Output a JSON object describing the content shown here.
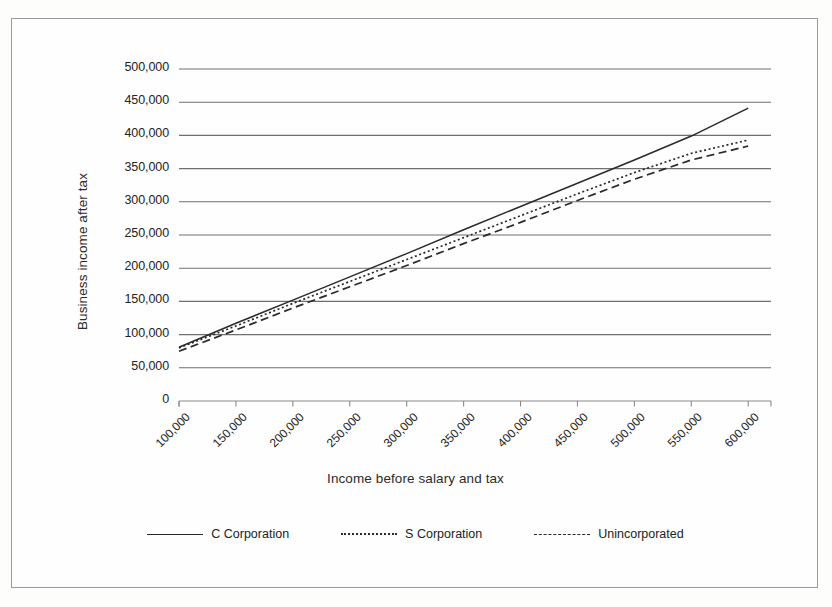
{
  "figure": {
    "background_color": "#fefefe",
    "border_color": "#9a9a9a"
  },
  "chart_data": {
    "type": "line",
    "title": "",
    "xlabel": "Income before salary and tax",
    "ylabel": "Business income after tax",
    "x": [
      100000,
      150000,
      200000,
      250000,
      300000,
      350000,
      400000,
      450000,
      500000,
      550000,
      600000
    ],
    "xlim": [
      100000,
      620000
    ],
    "ylim": [
      0,
      500000
    ],
    "ytick_labels": [
      "500,000",
      "450,000",
      "400,000",
      "350,000",
      "300,000",
      "250,000",
      "200,000",
      "150,000",
      "100,000",
      "50,000",
      "0"
    ],
    "ytick_values": [
      500000,
      450000,
      400000,
      350000,
      300000,
      250000,
      200000,
      150000,
      100000,
      50000,
      0
    ],
    "xtick_labels": [
      "100,000",
      "150,000",
      "200,000",
      "250,000",
      "300,000",
      "350,000",
      "400,000",
      "450,000",
      "500,000",
      "550,000",
      "600,000"
    ],
    "grid": "horizontal",
    "legend_position": "bottom",
    "series": [
      {
        "name": "C Corporation",
        "style": "solid",
        "color": "#2a2a2a",
        "values": [
          81000,
          117000,
          152000,
          187000,
          222000,
          258000,
          293000,
          328000,
          363000,
          399000,
          441000
        ]
      },
      {
        "name": "S Corporation",
        "style": "dotted",
        "color": "#2a2a2a",
        "values": [
          80000,
          113000,
          147000,
          180000,
          213000,
          246000,
          279000,
          312000,
          344000,
          373000,
          393000
        ]
      },
      {
        "name": "Unincorporated",
        "style": "dashed",
        "color": "#2a2a2a",
        "values": [
          75000,
          107000,
          140000,
          172000,
          204000,
          237000,
          269000,
          302000,
          334000,
          363000,
          384000
        ]
      }
    ]
  },
  "legend": {
    "items": [
      {
        "label": "C Corporation",
        "style": "solid"
      },
      {
        "label": "S Corporation",
        "style": "dotted"
      },
      {
        "label": "Unincorporated",
        "style": "dashed"
      }
    ]
  }
}
